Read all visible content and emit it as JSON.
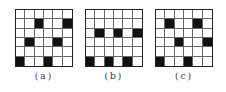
{
  "figure": {
    "panels": [
      {
        "id": "a",
        "label": "(a)",
        "rows": 6,
        "cols": 6,
        "left": 15,
        "filled": [
          [
            1,
            2
          ],
          [
            1,
            5
          ],
          [
            3,
            1
          ],
          [
            3,
            4
          ],
          [
            5,
            0
          ],
          [
            5,
            3
          ]
        ]
      },
      {
        "id": "b",
        "label": "(b)",
        "rows": 6,
        "cols": 6,
        "left": 85,
        "filled": [
          [
            2,
            1
          ],
          [
            2,
            3
          ],
          [
            2,
            5
          ],
          [
            5,
            0
          ],
          [
            5,
            2
          ],
          [
            5,
            4
          ]
        ]
      },
      {
        "id": "c",
        "label": "(c)",
        "rows": 6,
        "cols": 6,
        "left": 155,
        "filled": [
          [
            1,
            1
          ],
          [
            1,
            4
          ],
          [
            3,
            2
          ],
          [
            3,
            5
          ],
          [
            5,
            0
          ],
          [
            5,
            3
          ]
        ]
      }
    ],
    "colors": {
      "filled": "#111111",
      "empty": "#ffffff",
      "grid_line": "#666666",
      "border": "#222222"
    }
  }
}
